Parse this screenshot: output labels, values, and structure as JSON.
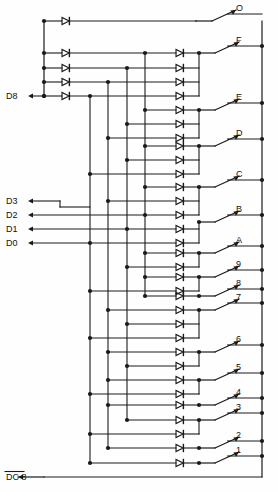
{
  "diagram": {
    "type": "schematic",
    "line_color": "#1a1a1a",
    "background": "#fefefe",
    "canvas": {
      "width": 278,
      "height": 492
    }
  },
  "geometry": {
    "left_bus_x": 44,
    "diode_col1_x": 66,
    "diode_col2_x": 180,
    "collector_x": 199,
    "right_bus_x": 262,
    "data_bus_x": [
      90,
      108,
      127,
      145
    ],
    "switch_label_x": 236,
    "row_top_y": 21,
    "row_pitch": 14.2,
    "bottom_rail_y": 477
  },
  "outputs": {
    "title": "Switch output lines (right side)",
    "items": [
      {
        "label": "O",
        "y": 21,
        "has_node": false
      },
      {
        "label": "F",
        "y": 53,
        "has_node": true
      },
      {
        "label": "E",
        "y": 110,
        "has_node": true
      },
      {
        "label": "D",
        "y": 146,
        "has_node": true
      },
      {
        "label": "C",
        "y": 187,
        "has_node": true
      },
      {
        "label": "B",
        "y": 222,
        "has_node": true
      },
      {
        "label": "A",
        "y": 253,
        "has_node": true
      },
      {
        "label": "9",
        "y": 277,
        "has_node": true
      },
      {
        "label": "8",
        "y": 296,
        "has_node": true
      },
      {
        "label": "7",
        "y": 310,
        "has_node": true
      },
      {
        "label": "6",
        "y": 352,
        "has_node": true
      },
      {
        "label": "5",
        "y": 380,
        "has_node": true
      },
      {
        "label": "4",
        "y": 405,
        "has_node": true
      },
      {
        "label": "3",
        "y": 420,
        "has_node": true
      },
      {
        "label": "2",
        "y": 448,
        "has_node": true
      },
      {
        "label": "1",
        "y": 463,
        "has_node": true
      }
    ]
  },
  "inputs": {
    "title": "Data / strobe lines (left side)",
    "items": [
      {
        "label": "D8",
        "y": 96,
        "overbar": false
      },
      {
        "label": "D3",
        "y": 201,
        "overbar": false
      },
      {
        "label": "D2",
        "y": 215,
        "overbar": false
      },
      {
        "label": "D1",
        "y": 229,
        "overbar": false
      },
      {
        "label": "D0",
        "y": 243,
        "overbar": false
      }
    ],
    "strobe": {
      "label": "DC 8",
      "y": 477,
      "overbar": true
    }
  },
  "matrix_rows": [
    {
      "y": 21,
      "col1": true,
      "col2": false,
      "bus_taps": []
    },
    {
      "y": 53,
      "col1": true,
      "col2": true,
      "bus_taps": [
        145
      ]
    },
    {
      "y": 68,
      "col1": true,
      "col2": true,
      "bus_taps": [
        127
      ]
    },
    {
      "y": 82,
      "col1": true,
      "col2": true,
      "bus_taps": [
        108
      ]
    },
    {
      "y": 96,
      "col1": true,
      "col2": true,
      "bus_taps": [
        90
      ]
    },
    {
      "y": 110,
      "col1": false,
      "col2": true,
      "bus_taps": [
        145
      ]
    },
    {
      "y": 124,
      "col1": false,
      "col2": true,
      "bus_taps": [
        127
      ]
    },
    {
      "y": 138,
      "col1": false,
      "col2": true,
      "bus_taps": [
        108
      ]
    },
    {
      "y": 146,
      "col1": false,
      "col2": true,
      "bus_taps": [
        145
      ]
    },
    {
      "y": 160,
      "col1": false,
      "col2": true,
      "bus_taps": [
        127
      ]
    },
    {
      "y": 174,
      "col1": false,
      "col2": true,
      "bus_taps": [
        90
      ]
    },
    {
      "y": 187,
      "col1": false,
      "col2": true,
      "bus_taps": [
        145
      ]
    },
    {
      "y": 201,
      "col1": false,
      "col2": true,
      "bus_taps": [
        108
      ]
    },
    {
      "y": 215,
      "col1": false,
      "col2": true,
      "bus_taps": [
        145
      ]
    },
    {
      "y": 229,
      "col1": false,
      "col2": true,
      "bus_taps": [
        127
      ]
    },
    {
      "y": 243,
      "col1": false,
      "col2": true,
      "bus_taps": [
        90
      ]
    },
    {
      "y": 253,
      "col1": false,
      "col2": true,
      "bus_taps": [
        145
      ]
    },
    {
      "y": 267,
      "col1": false,
      "col2": true,
      "bus_taps": [
        127
      ]
    },
    {
      "y": 277,
      "col1": false,
      "col2": true,
      "bus_taps": [
        145
      ]
    },
    {
      "y": 291,
      "col1": false,
      "col2": true,
      "bus_taps": [
        90
      ]
    },
    {
      "y": 296,
      "col1": false,
      "col2": true,
      "bus_taps": [
        145
      ]
    },
    {
      "y": 310,
      "col1": false,
      "col2": true,
      "bus_taps": [
        108
      ]
    },
    {
      "y": 324,
      "col1": false,
      "col2": true,
      "bus_taps": [
        127
      ]
    },
    {
      "y": 338,
      "col1": false,
      "col2": true,
      "bus_taps": [
        90
      ]
    },
    {
      "y": 352,
      "col1": false,
      "col2": true,
      "bus_taps": [
        108
      ]
    },
    {
      "y": 366,
      "col1": false,
      "col2": true,
      "bus_taps": [
        127
      ]
    },
    {
      "y": 380,
      "col1": false,
      "col2": true,
      "bus_taps": [
        108
      ]
    },
    {
      "y": 394,
      "col1": false,
      "col2": true,
      "bus_taps": [
        90
      ]
    },
    {
      "y": 405,
      "col1": false,
      "col2": true,
      "bus_taps": [
        108
      ]
    },
    {
      "y": 420,
      "col1": false,
      "col2": true,
      "bus_taps": [
        127
      ]
    },
    {
      "y": 434,
      "col1": false,
      "col2": true,
      "bus_taps": [
        90
      ]
    },
    {
      "y": 448,
      "col1": false,
      "col2": true,
      "bus_taps": [
        108
      ]
    },
    {
      "y": 463,
      "col1": false,
      "col2": true,
      "bus_taps": [
        90
      ]
    }
  ]
}
